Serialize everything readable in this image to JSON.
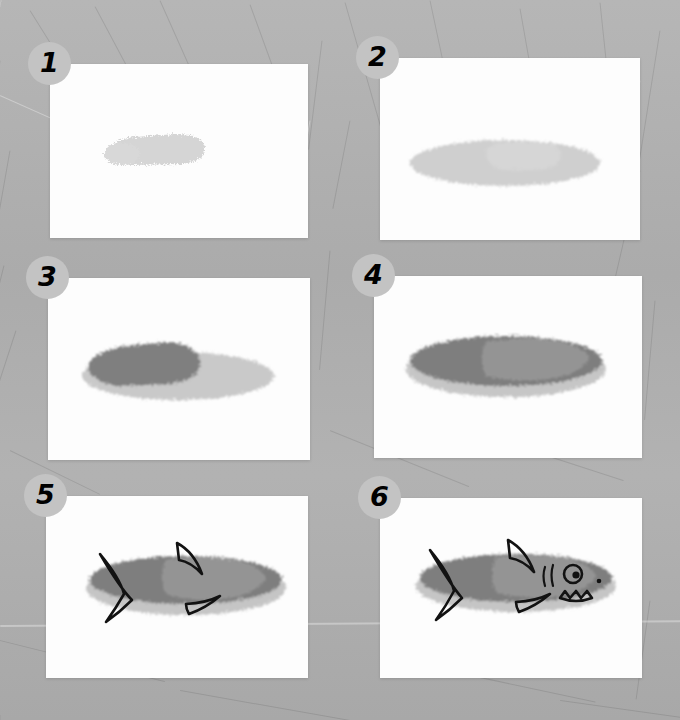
{
  "tutorial": {
    "subject": "shark",
    "title": "How to Draw a Shark",
    "step_count": 6
  },
  "background": {
    "color": "#b0b0b0",
    "texture": "scratched gray surface"
  },
  "palette": {
    "panel": "#fdfdfd",
    "badge_fill": "#c3c3c3",
    "badge_text": "#000000",
    "body_light": "#d4d4d4",
    "body_mid": "#bdbdbd",
    "body_dark": "#7d7d7d",
    "head_gray": "#949494",
    "belly_gray": "#c2c2c2",
    "ink": "#111111"
  },
  "steps": [
    {
      "number": "1",
      "badge": "1",
      "name": "step-1",
      "caption": "Light gray rounded head blob",
      "elements": [
        "head-blob"
      ]
    },
    {
      "number": "2",
      "badge": "2",
      "name": "step-2",
      "caption": "Add light gray elongated body ellipse",
      "elements": [
        "head-blob",
        "body-ellipse"
      ]
    },
    {
      "number": "3",
      "badge": "3",
      "name": "step-3",
      "caption": "Darken the front of the body",
      "elements": [
        "body-ellipse",
        "dark-front"
      ]
    },
    {
      "number": "4",
      "badge": "4",
      "name": "step-4",
      "caption": "Fill the whole body dark gray, keep light belly",
      "elements": [
        "dark-body",
        "light-head-patch",
        "belly"
      ]
    },
    {
      "number": "5",
      "badge": "5",
      "name": "step-5",
      "caption": "Add tail fin, dorsal fin and pectoral fin",
      "elements": [
        "dark-body",
        "light-head-patch",
        "belly",
        "tail-fin",
        "dorsal-fin",
        "pectoral-fin"
      ]
    },
    {
      "number": "6",
      "badge": "6",
      "name": "step-6",
      "caption": "Add eye, gills, nostril and toothy mouth",
      "elements": [
        "dark-body",
        "light-head-patch",
        "belly",
        "tail-fin",
        "dorsal-fin",
        "pectoral-fin",
        "eye",
        "gills",
        "nostril",
        "mouth-teeth"
      ]
    }
  ]
}
